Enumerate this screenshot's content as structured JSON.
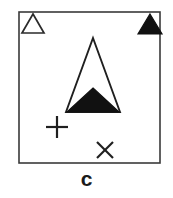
{
  "figure": {
    "caption": "c",
    "background_color": "#ffffff",
    "stroke_color": "#3a3a3a",
    "fill_color": "#111111",
    "frame": {
      "label": "diagram-frame",
      "x": 19,
      "y": 12,
      "width": 141,
      "height": 151,
      "stroke_width": 1.6
    },
    "shapes": [
      {
        "id": "legend-open-triangle",
        "name": "open-triangle-marker",
        "type": "triangle",
        "style": "outline",
        "apex_x": 33,
        "apex_y": 14,
        "base_y": 33,
        "half_width": 11
      },
      {
        "id": "legend-filled-triangle",
        "name": "filled-triangle-marker",
        "type": "triangle",
        "style": "filled",
        "apex_x": 150,
        "apex_y": 14,
        "base_y": 34,
        "half_width": 12
      },
      {
        "id": "main-open-triangle",
        "name": "large-open-triangle",
        "type": "triangle",
        "style": "outline",
        "apex_x": 93,
        "apex_y": 38,
        "base_y": 112,
        "half_width": 27
      },
      {
        "id": "main-filled-triangle",
        "name": "large-filled-triangle",
        "type": "triangle",
        "style": "filled",
        "apex_x": 93,
        "apex_y": 88,
        "base_y": 112,
        "half_width": 26
      },
      {
        "id": "plus-marker",
        "name": "plus-marker",
        "type": "plus",
        "center_x": 57,
        "center_y": 127,
        "arm": 11,
        "stroke_width": 2.2
      },
      {
        "id": "cross-marker",
        "name": "cross-marker",
        "type": "cross",
        "center_x": 105,
        "center_y": 150,
        "arm": 8,
        "stroke_width": 2.2
      }
    ]
  }
}
